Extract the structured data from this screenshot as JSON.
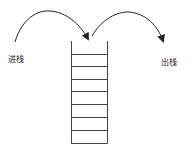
{
  "diagram": {
    "labels": {
      "push": "进栈",
      "pop": "出栈"
    },
    "stack": {
      "slots": 8
    },
    "colors": {
      "line": "#333333",
      "background": "#ffffff"
    }
  }
}
